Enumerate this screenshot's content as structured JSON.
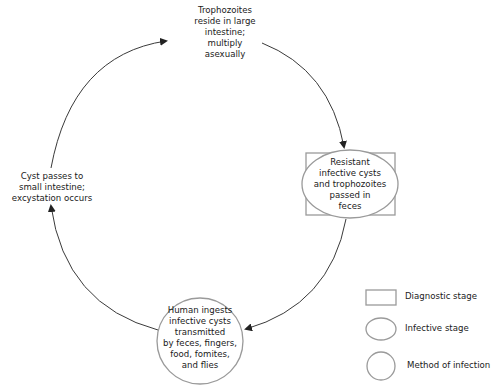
{
  "colors": {
    "background": "#ffffff",
    "shape_stroke": "#9a9a9a",
    "arrow_stroke": "#3a3a3a",
    "text": "#1a1a1a"
  },
  "stages": [
    {
      "id": "trophozoites",
      "lines": [
        "Trophozoites",
        "reside in large",
        "intestine;",
        "multiply",
        "asexually"
      ]
    },
    {
      "id": "diagnostic-infective",
      "shape": "square+ellipse",
      "lines": [
        "Resistant",
        "infective cysts",
        "and trophozoites",
        "passed in",
        "feces"
      ]
    },
    {
      "id": "human-ingests",
      "shape": "circle",
      "lines": [
        "Human ingests",
        "infective cysts",
        "transmitted",
        "by feces, fingers,",
        "food, fomites,",
        "and flies"
      ]
    },
    {
      "id": "excystation",
      "lines": [
        "Cyst passes to",
        "small intestine;",
        "excystation occurs"
      ]
    }
  ],
  "legend": [
    {
      "shape": "rectangle",
      "label": "Diagnostic stage"
    },
    {
      "shape": "ellipse",
      "label": "Infective stage"
    },
    {
      "shape": "circle",
      "label": "Method of infection"
    }
  ]
}
